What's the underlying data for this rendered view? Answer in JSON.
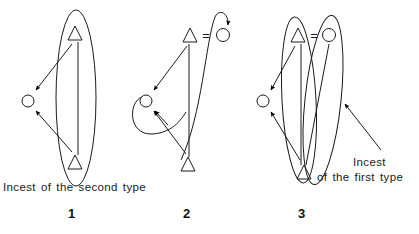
{
  "figure": {
    "width": 419,
    "height": 234,
    "background_color": "#ffffff",
    "stroke_color": "#1a1a1a",
    "marker_fill_color": "#000000"
  },
  "captions": {
    "second_type": "Incest of the second type",
    "first_type_line1": "Incest",
    "first_type_line2": "of the first type"
  },
  "panels": [
    {
      "number": "1",
      "label": "panel-1",
      "caption": "Incest of the second type",
      "description": "Single vertical ellipse enclosing two triangles joined by a vertical descent line; two arrows point left to an unenclosed circle.",
      "nodes": [
        {
          "id": "p1-triangle-top",
          "symbol": "triangle",
          "x": 75,
          "y": 33
        },
        {
          "id": "p1-triangle-bottom",
          "symbol": "triangle",
          "x": 75,
          "y": 162
        },
        {
          "id": "p1-circle-left",
          "symbol": "circle",
          "x": 28,
          "y": 101
        }
      ],
      "groups": [
        {
          "id": "p1-ellipse",
          "shape": "ellipse",
          "cx": 76,
          "cy": 98,
          "rx": 20,
          "ry": 88
        }
      ],
      "arrows": [
        {
          "id": "p1-arrow-top-to-circle",
          "from": "p1-triangle-top",
          "to": "p1-circle-left"
        },
        {
          "id": "p1-arrow-bottom-to-circle",
          "from": "p1-triangle-bottom",
          "to": "p1-circle-left"
        }
      ]
    },
    {
      "number": "2",
      "label": "panel-2",
      "caption": "",
      "description": "Triangle equals circle at top with a curved arrow looping to the circle; lower triangle links upward; a self-looping arrow returns to the left circle.",
      "nodes": [
        {
          "id": "p2-triangle-top",
          "symbol": "triangle",
          "x": 190,
          "y": 35
        },
        {
          "id": "p2-equals-top",
          "symbol": "equals",
          "x": 206,
          "y": 35
        },
        {
          "id": "p2-circle-top",
          "symbol": "circle",
          "x": 223,
          "y": 35
        },
        {
          "id": "p2-circle-left",
          "symbol": "circle",
          "x": 146,
          "y": 101
        },
        {
          "id": "p2-triangle-bottom",
          "symbol": "triangle",
          "x": 188,
          "y": 164
        }
      ],
      "groups": [],
      "arrows": [
        {
          "id": "p2-arrow-curve-to-top-circle",
          "from": "p2-triangle-top",
          "to": "p2-circle-top"
        },
        {
          "id": "p2-arrow-top-to-left-circle",
          "from": "p2-triangle-top",
          "to": "p2-circle-left"
        },
        {
          "id": "p2-arrow-bottom-to-left-circle",
          "from": "p2-triangle-bottom",
          "to": "p2-circle-left"
        },
        {
          "id": "p2-arrow-self-loop-left-circle",
          "from": "p2-circle-left",
          "to": "p2-circle-left"
        }
      ]
    },
    {
      "number": "3",
      "label": "panel-3",
      "caption": "Incest of the first type",
      "description": "Two overlapping vertical ellipses; triangle equals circle at top, shared lower triangle; two arrows point left to an unenclosed circle; an annotation arrow points at the right ellipse.",
      "nodes": [
        {
          "id": "p3-triangle-top",
          "symbol": "triangle",
          "x": 298,
          "y": 35
        },
        {
          "id": "p3-equals-top",
          "symbol": "equals",
          "x": 314,
          "y": 35
        },
        {
          "id": "p3-circle-top",
          "symbol": "circle",
          "x": 329,
          "y": 35
        },
        {
          "id": "p3-circle-left",
          "symbol": "circle",
          "x": 263,
          "y": 101
        },
        {
          "id": "p3-triangle-bottom",
          "symbol": "triangle",
          "x": 304,
          "y": 172
        }
      ],
      "groups": [
        {
          "id": "p3-ellipse-left",
          "shape": "ellipse",
          "cx": 299,
          "cy": 100,
          "rx": 17,
          "ry": 83
        },
        {
          "id": "p3-ellipse-right",
          "shape": "ellipse",
          "cx": 323,
          "cy": 100,
          "rx": 18,
          "ry": 85
        }
      ],
      "arrows": [
        {
          "id": "p3-arrow-top-to-circle",
          "from": "p3-triangle-top",
          "to": "p3-circle-left"
        },
        {
          "id": "p3-arrow-bottom-to-circle",
          "from": "p3-triangle-bottom",
          "to": "p3-circle-left"
        },
        {
          "id": "p3-arrow-annotation",
          "from": "caption-first-type",
          "to": "p3-ellipse-right"
        }
      ]
    }
  ],
  "legend": {
    "triangle_meaning": "male",
    "circle_meaning": "female",
    "equals_meaning": "marriage union",
    "ellipse_meaning": "descent group",
    "arrow_meaning": "incestuous relation"
  }
}
